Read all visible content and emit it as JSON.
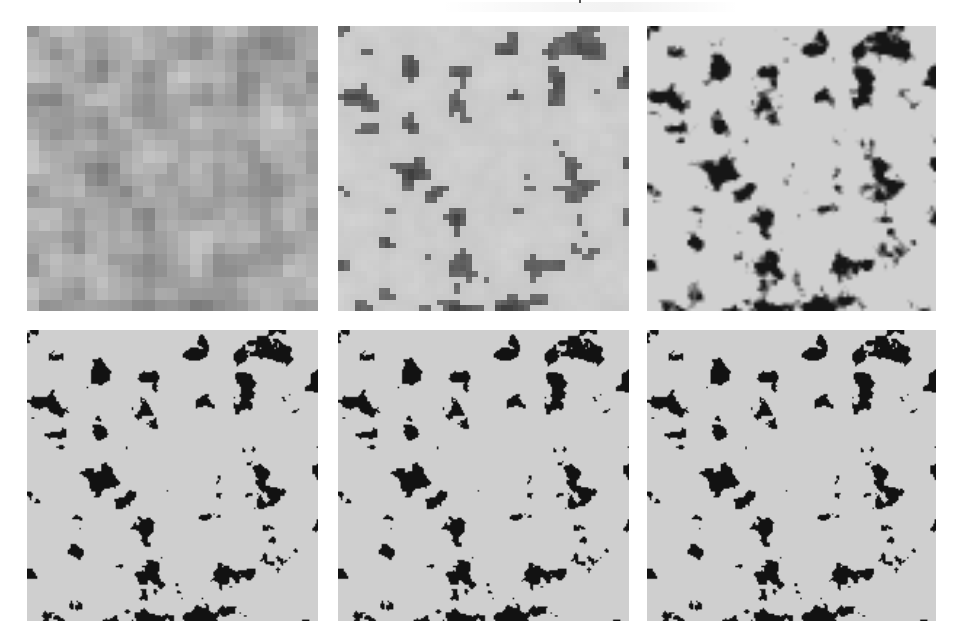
{
  "figure": {
    "background": "#ffffff",
    "layout": {
      "rows": 2,
      "cols": 3
    },
    "panels": [
      {
        "id": "panel-1",
        "row": 0,
        "col": 0,
        "x": 27,
        "y": 26,
        "w": 291,
        "h": 285,
        "kind": "coarse-gray",
        "grid": 25,
        "seed": 11
      },
      {
        "id": "panel-2",
        "row": 0,
        "col": 1,
        "x": 338,
        "y": 26,
        "w": 291,
        "h": 285,
        "kind": "medium-gray",
        "grid": 50,
        "seed": 11
      },
      {
        "id": "panel-3",
        "row": 0,
        "col": 2,
        "x": 647,
        "y": 26,
        "w": 289,
        "h": 285,
        "kind": "fine-smooth",
        "grid": 100,
        "seed": 11
      },
      {
        "id": "panel-4",
        "row": 1,
        "col": 0,
        "x": 27,
        "y": 330,
        "w": 291,
        "h": 291,
        "kind": "binary",
        "grid": 200,
        "seed": 11
      },
      {
        "id": "panel-5",
        "row": 1,
        "col": 1,
        "x": 338,
        "y": 330,
        "w": 291,
        "h": 291,
        "kind": "binary",
        "grid": 200,
        "seed": 11
      },
      {
        "id": "panel-6",
        "row": 1,
        "col": 2,
        "x": 647,
        "y": 330,
        "w": 289,
        "h": 291,
        "kind": "binary",
        "grid": 200,
        "seed": 11
      }
    ],
    "colors": {
      "solid_phase": "#cfcfcf",
      "pore_phase": "#121212",
      "coarse_light": "#d4d4d4",
      "coarse_dark": "#4a4a4a"
    }
  }
}
